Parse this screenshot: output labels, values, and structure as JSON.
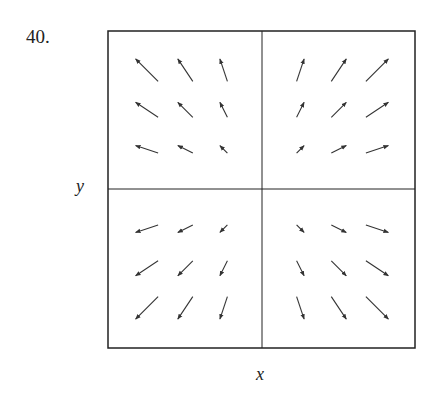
{
  "problem_number": "40.",
  "chart_data": {
    "type": "vector-field",
    "title": "",
    "xlabel": "x",
    "ylabel": "y",
    "xlim": [
      -4,
      4
    ],
    "ylim": [
      -4,
      4
    ],
    "grid": false,
    "axes_through_origin": true,
    "field": "F(x, y) = (x, y)",
    "x": [
      -3,
      -2,
      -1,
      1,
      2,
      3
    ],
    "y": [
      -3,
      -2,
      -1,
      1,
      2,
      3
    ],
    "vectors": [
      {
        "x": -3,
        "y": 3,
        "u": -3,
        "v": 3
      },
      {
        "x": -2,
        "y": 3,
        "u": -2,
        "v": 3
      },
      {
        "x": -1,
        "y": 3,
        "u": -1,
        "v": 3
      },
      {
        "x": 1,
        "y": 3,
        "u": 1,
        "v": 3
      },
      {
        "x": 2,
        "y": 3,
        "u": 2,
        "v": 3
      },
      {
        "x": 3,
        "y": 3,
        "u": 3,
        "v": 3
      },
      {
        "x": -3,
        "y": 2,
        "u": -3,
        "v": 2
      },
      {
        "x": -2,
        "y": 2,
        "u": -2,
        "v": 2
      },
      {
        "x": -1,
        "y": 2,
        "u": -1,
        "v": 2
      },
      {
        "x": 1,
        "y": 2,
        "u": 1,
        "v": 2
      },
      {
        "x": 2,
        "y": 2,
        "u": 2,
        "v": 2
      },
      {
        "x": 3,
        "y": 2,
        "u": 3,
        "v": 2
      },
      {
        "x": -3,
        "y": 1,
        "u": -3,
        "v": 1
      },
      {
        "x": -2,
        "y": 1,
        "u": -2,
        "v": 1
      },
      {
        "x": -1,
        "y": 1,
        "u": -1,
        "v": 1
      },
      {
        "x": 1,
        "y": 1,
        "u": 1,
        "v": 1
      },
      {
        "x": 2,
        "y": 1,
        "u": 2,
        "v": 1
      },
      {
        "x": 3,
        "y": 1,
        "u": 3,
        "v": 1
      },
      {
        "x": -3,
        "y": -1,
        "u": -3,
        "v": -1
      },
      {
        "x": -2,
        "y": -1,
        "u": -2,
        "v": -1
      },
      {
        "x": -1,
        "y": -1,
        "u": -1,
        "v": -1
      },
      {
        "x": 1,
        "y": -1,
        "u": 1,
        "v": -1
      },
      {
        "x": 2,
        "y": -1,
        "u": 2,
        "v": -1
      },
      {
        "x": 3,
        "y": -1,
        "u": 3,
        "v": -1
      },
      {
        "x": -3,
        "y": -2,
        "u": -3,
        "v": -2
      },
      {
        "x": -2,
        "y": -2,
        "u": -2,
        "v": -2
      },
      {
        "x": -1,
        "y": -2,
        "u": -1,
        "v": -2
      },
      {
        "x": 1,
        "y": -2,
        "u": 1,
        "v": -2
      },
      {
        "x": 2,
        "y": -2,
        "u": 2,
        "v": -2
      },
      {
        "x": 3,
        "y": -2,
        "u": 3,
        "v": -2
      },
      {
        "x": -3,
        "y": -3,
        "u": -3,
        "v": -3
      },
      {
        "x": -2,
        "y": -3,
        "u": -2,
        "v": -3
      },
      {
        "x": -1,
        "y": -3,
        "u": -1,
        "v": -3
      },
      {
        "x": 1,
        "y": -3,
        "u": 1,
        "v": -3
      },
      {
        "x": 2,
        "y": -3,
        "u": 2,
        "v": -3
      },
      {
        "x": 3,
        "y": -3,
        "u": 3,
        "v": -3
      }
    ],
    "colors": {
      "frame": "#222222",
      "arrow": "#333333"
    }
  }
}
